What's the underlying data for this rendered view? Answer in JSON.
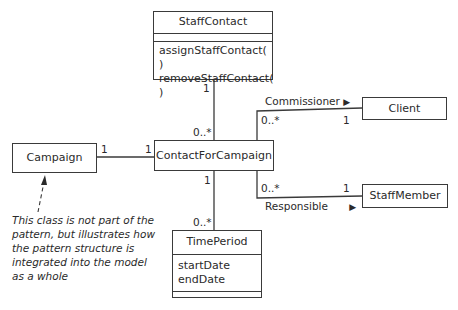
{
  "classes": {
    "staff_contact": {
      "name": "StaffContact",
      "attributes": [],
      "operations": [
        "assignStaffContact( )",
        "removeStaffContact( )"
      ]
    },
    "contact_for_campaign": {
      "name": "ContactForCampaign"
    },
    "campaign": {
      "name": "Campaign"
    },
    "client": {
      "name": "Client"
    },
    "staff_member": {
      "name": "StaffMember"
    },
    "time_period": {
      "name": "TimePeriod",
      "attributes": [
        "startDate",
        "endDate"
      ],
      "operations": []
    }
  },
  "associations": {
    "staff_contact_link": {
      "end_staff_contact": "1",
      "end_contact_for_campaign": "0..*"
    },
    "campaign_link": {
      "end_campaign": "1",
      "end_contact_for_campaign": "1"
    },
    "commissioner": {
      "label": "Commissioner",
      "arrow": "▶",
      "end_contact_for_campaign": "0..*",
      "end_client": "1"
    },
    "responsible": {
      "label": "Responsible",
      "arrow": "▶",
      "end_contact_for_campaign": "0..*",
      "end_staff_member": "1"
    },
    "time_period_link": {
      "end_contact_for_campaign": "1",
      "end_time_period": "0..*"
    }
  },
  "note": {
    "text": "This class is not part of the pattern, but illustrates how the pattern structure is integrated into the model as a whole"
  }
}
